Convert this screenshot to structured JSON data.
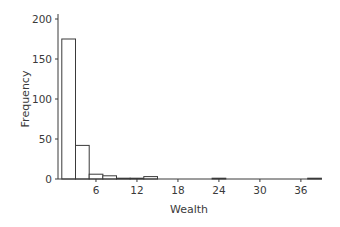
{
  "chart_data": {
    "type": "bar",
    "subtype": "histogram",
    "title": "",
    "xlabel": "Wealth",
    "ylabel": "Frequency",
    "xlim": [
      0,
      39
    ],
    "ylim": [
      0,
      200
    ],
    "xticks": [
      6,
      12,
      18,
      24,
      30,
      36
    ],
    "yticks": [
      0,
      50,
      100,
      150,
      200
    ],
    "grid": false,
    "legend": null,
    "bin_width": 2,
    "bins": [
      {
        "start": 1,
        "end": 3,
        "count": 175
      },
      {
        "start": 3,
        "end": 5,
        "count": 42
      },
      {
        "start": 5,
        "end": 7,
        "count": 6
      },
      {
        "start": 7,
        "end": 9,
        "count": 4
      },
      {
        "start": 9,
        "end": 11,
        "count": 1
      },
      {
        "start": 11,
        "end": 13,
        "count": 1
      },
      {
        "start": 13,
        "end": 15,
        "count": 3
      },
      {
        "start": 15,
        "end": 17,
        "count": 0
      },
      {
        "start": 17,
        "end": 19,
        "count": 0
      },
      {
        "start": 19,
        "end": 21,
        "count": 0
      },
      {
        "start": 21,
        "end": 23,
        "count": 0
      },
      {
        "start": 23,
        "end": 25,
        "count": 1
      },
      {
        "start": 25,
        "end": 27,
        "count": 0
      },
      {
        "start": 27,
        "end": 29,
        "count": 0
      },
      {
        "start": 29,
        "end": 31,
        "count": 0
      },
      {
        "start": 31,
        "end": 33,
        "count": 0
      },
      {
        "start": 33,
        "end": 35,
        "count": 0
      },
      {
        "start": 35,
        "end": 37,
        "count": 0
      },
      {
        "start": 37,
        "end": 39,
        "count": 1
      }
    ],
    "colors": {
      "bar_fill": "#ffffff",
      "bar_stroke": "#3a3a3a",
      "axis": "#3a3a3a"
    }
  }
}
